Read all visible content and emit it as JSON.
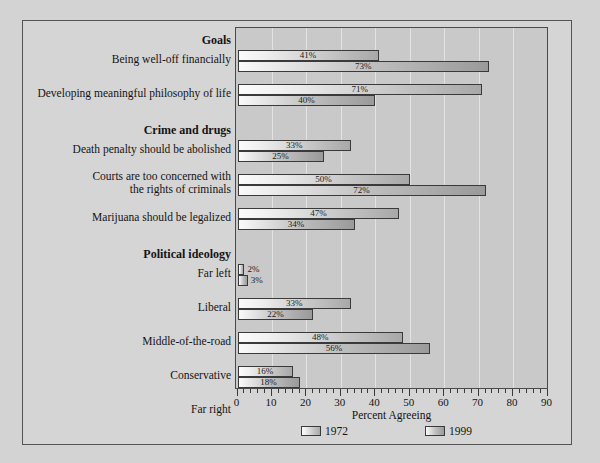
{
  "chart_data": {
    "type": "bar",
    "orientation": "horizontal",
    "title": "",
    "xlabel": "Percent Agreeing",
    "ylabel": "",
    "xlim": [
      0,
      90
    ],
    "xticks": [
      0,
      10,
      20,
      30,
      40,
      50,
      60,
      70,
      80,
      90
    ],
    "minor_tick_step": 2,
    "grid": "vertical",
    "legend_position": "bottom",
    "series": [
      {
        "name": "1972",
        "values": [
          41,
          71,
          33,
          50,
          47,
          2,
          33,
          48,
          16,
          1
        ]
      },
      {
        "name": "1999",
        "values": [
          73,
          40,
          25,
          72,
          34,
          3,
          22,
          56,
          18,
          2
        ]
      }
    ],
    "categories": [
      "Being well-off financially",
      "Developing meaningful philosophy of life",
      "Death penalty should be abolished",
      "Courts are too concerned with the rights of criminals",
      "Marijuana should be legalized",
      "Far left",
      "Liberal",
      "Middle-of-the-road",
      "Conservative",
      "Far right"
    ],
    "group_headings": [
      "Goals",
      "Crime and drugs",
      "Political ideology"
    ]
  },
  "axis": {
    "title": "Percent Agreeing",
    "tick_labels": [
      "0",
      "10",
      "20",
      "30",
      "40",
      "50",
      "60",
      "70",
      "80",
      "90"
    ]
  },
  "legend": {
    "items": [
      {
        "label": "1972",
        "swatch": "gradient-light-gray"
      },
      {
        "label": "1999",
        "swatch": "gradient-light-gray"
      }
    ]
  },
  "groups": [
    {
      "heading": "Goals",
      "rows": [
        {
          "label_lines": [
            "Being well-off financially"
          ],
          "bars": [
            {
              "series": "1972",
              "value": 41,
              "value_label": "41%",
              "label_pos": "inside"
            },
            {
              "series": "1999",
              "value": 73,
              "value_label": "73%",
              "label_pos": "inside"
            }
          ]
        },
        {
          "label_lines": [
            "Developing meaningful philosophy of life"
          ],
          "bars": [
            {
              "series": "1972",
              "value": 71,
              "value_label": "71%",
              "label_pos": "inside"
            },
            {
              "series": "1999",
              "value": 40,
              "value_label": "40%",
              "label_pos": "inside"
            }
          ]
        }
      ]
    },
    {
      "heading": "Crime and drugs",
      "rows": [
        {
          "label_lines": [
            "Death penalty should be abolished"
          ],
          "bars": [
            {
              "series": "1972",
              "value": 33,
              "value_label": "33%",
              "label_pos": "inside"
            },
            {
              "series": "1999",
              "value": 25,
              "value_label": "25%",
              "label_pos": "inside"
            }
          ]
        },
        {
          "label_lines": [
            "Courts are too concerned with",
            "the rights of criminals"
          ],
          "bars": [
            {
              "series": "1972",
              "value": 50,
              "value_label": "50%",
              "label_pos": "inside"
            },
            {
              "series": "1999",
              "value": 72,
              "value_label": "72%",
              "label_pos": "inside"
            }
          ]
        },
        {
          "label_lines": [
            "Marijuana should be legalized"
          ],
          "bars": [
            {
              "series": "1972",
              "value": 47,
              "value_label": "47%",
              "label_pos": "inside"
            },
            {
              "series": "1999",
              "value": 34,
              "value_label": "34%",
              "label_pos": "inside"
            }
          ]
        }
      ]
    },
    {
      "heading": "Political ideology",
      "rows": [
        {
          "label_lines": [
            "Far left"
          ],
          "bars": [
            {
              "series": "1972",
              "value": 2,
              "value_label": "2%",
              "label_pos": "outside"
            },
            {
              "series": "1999",
              "value": 3,
              "value_label": "3%",
              "label_pos": "outside"
            }
          ]
        },
        {
          "label_lines": [
            "Liberal"
          ],
          "bars": [
            {
              "series": "1972",
              "value": 33,
              "value_label": "33%",
              "label_pos": "inside"
            },
            {
              "series": "1999",
              "value": 22,
              "value_label": "22%",
              "label_pos": "inside"
            }
          ]
        },
        {
          "label_lines": [
            "Middle-of-the-road"
          ],
          "bars": [
            {
              "series": "1972",
              "value": 48,
              "value_label": "48%",
              "label_pos": "inside"
            },
            {
              "series": "1999",
              "value": 56,
              "value_label": "56%",
              "label_pos": "inside"
            }
          ]
        },
        {
          "label_lines": [
            "Conservative"
          ],
          "bars": [
            {
              "series": "1972",
              "value": 16,
              "value_label": "16%",
              "label_pos": "inside"
            },
            {
              "series": "1999",
              "value": 18,
              "value_label": "18%",
              "label_pos": "inside"
            }
          ]
        },
        {
          "label_lines": [
            "Far right"
          ],
          "bars": [
            {
              "series": "1972",
              "value": 1,
              "value_label": "1%",
              "label_pos": "outside"
            },
            {
              "series": "1999",
              "value": 2,
              "value_label": "2%",
              "label_pos": "outside"
            }
          ]
        }
      ]
    }
  ],
  "colors": {
    "figure_background": "#d3d3d3",
    "plot_background": "#c9c9c9",
    "gridline": "#e2e2e2",
    "axis": "#4a4a4a",
    "text": "#141414",
    "bar_border": "#3a3a3a"
  }
}
